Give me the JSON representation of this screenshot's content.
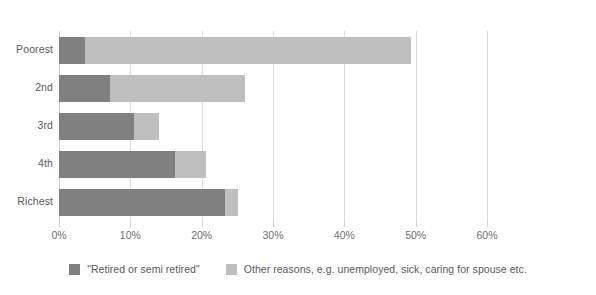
{
  "chart_data": {
    "type": "bar",
    "orientation": "horizontal",
    "stacked": true,
    "title": "",
    "subtitle": "",
    "xlabel": "",
    "ylabel": "",
    "categories": [
      "Poorest",
      "2nd",
      "3rd",
      "4th",
      "Richest"
    ],
    "series": [
      {
        "name": "\"Retired or semi retired\"",
        "color": "#808080",
        "values": [
          3.6,
          7.2,
          10.5,
          16.3,
          23.3
        ]
      },
      {
        "name": "Other reasons, e.g. unemployed, sick, caring for spouse etc.",
        "color": "#bfbfbf",
        "values": [
          45.7,
          18.9,
          3.5,
          4.3,
          1.8
        ]
      }
    ],
    "totals": [
      49.3,
      26.1,
      14.0,
      20.6,
      25.1
    ],
    "xlim": [
      0,
      60
    ],
    "xticks": [
      0,
      10,
      20,
      30,
      40,
      50,
      60
    ],
    "xtick_labels": [
      "0%",
      "10%",
      "20%",
      "30%",
      "40%",
      "50%",
      "60%"
    ],
    "grid": true,
    "grid_axis": "x",
    "legend_position": "bottom",
    "value_suffix": "%"
  },
  "legend": {
    "items": [
      {
        "label": "\"Retired or semi retired\"",
        "color": "#808080"
      },
      {
        "label": "Other reasons, e.g. unemployed, sick, caring for spouse etc.",
        "color": "#bfbfbf"
      }
    ]
  },
  "colors": {
    "background": "#ffffff",
    "series_retired": "#808080",
    "series_other": "#bfbfbf",
    "gridline": "#dcdcdc",
    "text": "#58585a",
    "axis_text": "#6d6d6f"
  }
}
